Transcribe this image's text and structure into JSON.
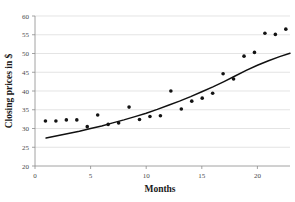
{
  "chart_data": {
    "type": "scatter",
    "title": "",
    "xlabel": "Months",
    "ylabel": "Closing prices in $",
    "xlim": [
      0,
      24.4
    ],
    "ylim": [
      20,
      60
    ],
    "xticks": [
      0,
      5,
      10,
      15,
      20
    ],
    "yticks": [
      20,
      25,
      30,
      35,
      40,
      45,
      50,
      55,
      60
    ],
    "grid": "horizontal",
    "legend": "none",
    "x": [
      1,
      2,
      3,
      4,
      5,
      6,
      7,
      8,
      9,
      10,
      11,
      12,
      13,
      14,
      15,
      16,
      17,
      18,
      19,
      20,
      21,
      22,
      23,
      24
    ],
    "values": [
      32.0,
      32.0,
      32.3,
      32.3,
      30.5,
      33.6,
      31.1,
      31.5,
      35.7,
      32.4,
      33.2,
      33.4,
      40.0,
      35.2,
      37.3,
      38.1,
      39.4,
      44.6,
      43.2,
      49.3,
      50.3,
      55.4,
      55.1,
      56.5
    ],
    "series": [
      {
        "name": "Closing price",
        "type": "scatter",
        "values": [
          32.0,
          32.0,
          32.3,
          32.3,
          30.5,
          33.6,
          31.1,
          31.5,
          35.7,
          32.4,
          33.2,
          33.4,
          40.0,
          35.2,
          37.3,
          38.1,
          39.4,
          44.6,
          43.2,
          49.3,
          50.3,
          55.4,
          55.1,
          56.5
        ]
      },
      {
        "name": "Trend curve",
        "type": "line",
        "x": [
          1,
          2,
          3,
          4,
          5,
          6,
          7,
          8,
          9,
          10,
          11,
          12,
          13,
          14,
          15,
          16,
          17,
          18,
          19,
          20,
          21,
          22,
          23,
          24
        ],
        "values": [
          28.3,
          28.9,
          29.4,
          30.0,
          30.7,
          31.4,
          32.2,
          33.0,
          33.9,
          34.8,
          35.8,
          36.9,
          38.0,
          39.2,
          40.5,
          41.8,
          43.2,
          44.7,
          46.2,
          47.6,
          48.8,
          49.9,
          50.8,
          51.5
        ]
      }
    ]
  },
  "axes": {
    "y_tick_labels": [
      "20",
      "25",
      "30",
      "35",
      "40",
      "45",
      "50",
      "55",
      "60"
    ],
    "x_tick_labels": [
      "0",
      "5",
      "10",
      "15",
      "20"
    ],
    "x_title": "Months",
    "y_title": "Closing prices in $"
  },
  "colors": {
    "point": "#131313",
    "curve": "#111111",
    "grid": "#d9d9d9",
    "axis": "#8c8c8c",
    "tick_text": "#4a4a4a",
    "title_text": "#1a1a1a",
    "background": "#ffffff"
  }
}
